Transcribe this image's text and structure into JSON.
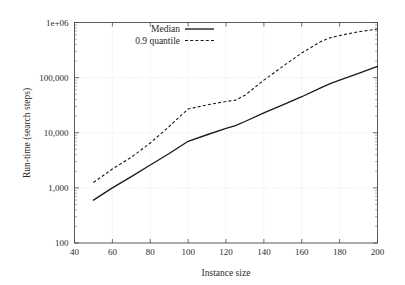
{
  "chart_data": {
    "type": "line",
    "title": "",
    "xlabel": "Instance size",
    "ylabel": "Run-time (search steps)",
    "xlim": [
      40,
      200
    ],
    "ylim": [
      100,
      1000000
    ],
    "yscale": "log",
    "xscale": "linear",
    "grid": true,
    "legend_position": "top-left-inside",
    "xticks": [
      40,
      60,
      80,
      100,
      120,
      140,
      160,
      180,
      200
    ],
    "xtick_labels": [
      "40",
      "60",
      "80",
      "100",
      "120",
      "140",
      "160",
      "180",
      "200"
    ],
    "yticks": [
      100,
      1000,
      10000,
      100000,
      1000000
    ],
    "ytick_labels": [
      "100",
      "1,000",
      "10,000",
      "100,000",
      "1e+06"
    ],
    "series": [
      {
        "name": "Median",
        "style": "solid",
        "color": "#1a1a1a",
        "x": [
          50,
          60,
          70,
          80,
          90,
          100,
          110,
          120,
          125,
          130,
          140,
          150,
          160,
          170,
          175,
          180,
          190,
          200
        ],
        "values": [
          600,
          1000,
          1600,
          2600,
          4200,
          7000,
          9200,
          12000,
          13500,
          16000,
          23000,
          32000,
          45000,
          65000,
          78000,
          90000,
          120000,
          160000
        ]
      },
      {
        "name": "0.9 quantile",
        "style": "dashed",
        "color": "#1a1a1a",
        "x": [
          50,
          60,
          70,
          80,
          90,
          100,
          110,
          120,
          125,
          130,
          140,
          150,
          160,
          170,
          175,
          180,
          190,
          200
        ],
        "values": [
          1250,
          2200,
          3600,
          6500,
          13000,
          27000,
          32000,
          37000,
          39000,
          48000,
          90000,
          160000,
          280000,
          450000,
          530000,
          580000,
          680000,
          760000
        ]
      }
    ]
  },
  "legend": {
    "entries": [
      {
        "label": "Median",
        "style": "solid"
      },
      {
        "label": "0.9 quantile",
        "style": "dashed"
      }
    ]
  }
}
